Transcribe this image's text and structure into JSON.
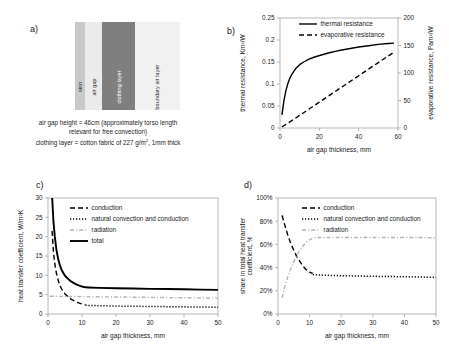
{
  "figure": {
    "panels": {
      "a": {
        "label": "a)"
      },
      "b": {
        "label": "b)"
      },
      "c": {
        "label": "c)"
      },
      "d": {
        "label": "d)"
      }
    }
  },
  "panel_a": {
    "layers": [
      {
        "name": "skin",
        "label": "skin",
        "color": "#c9c9c9"
      },
      {
        "name": "air-gap",
        "label": "air gap",
        "color": "#ebebeb"
      },
      {
        "name": "clothing-layer",
        "label": "clothing layer",
        "color": "#7f7f7f"
      },
      {
        "name": "boundary-air-layer",
        "label": "boundary air layer",
        "color": "#f1f1f1"
      }
    ],
    "caption_line1": "air gap height = 46cm (approximately torso length",
    "caption_line2": "relevant for free convection)",
    "caption_line3_pre": "clothing layer = cotton fabric of 227 g/m",
    "caption_line3_sup": "2",
    "caption_line3_post": ", 1mm thick"
  },
  "chart_data": [
    {
      "id": "panel-b",
      "type": "line",
      "title": "",
      "xlabel": "air gap thickness, mm",
      "ylabel": "thermal resistance, Km²/W",
      "y2label": "evaporative resistance, Pam²/W",
      "xlim": [
        0,
        60
      ],
      "ylim": [
        0,
        0.25
      ],
      "y2lim": [
        0,
        200
      ],
      "xticks": [
        0,
        20,
        40,
        60
      ],
      "yticks": [
        0,
        0.05,
        0.1,
        0.15,
        0.2,
        0.25
      ],
      "yticklabels": [
        "0",
        "0.05",
        "0.1",
        "0.15",
        "0.2",
        "0.25"
      ],
      "y2ticks": [
        0,
        50,
        100,
        150,
        200
      ],
      "grid": false,
      "legend_position": "top-center",
      "series": [
        {
          "name": "thermal resistance",
          "axis": "left",
          "style": "solid",
          "color": "#000000",
          "x": [
            1,
            2,
            3,
            4,
            5,
            6,
            8,
            10,
            12,
            15,
            18,
            21,
            25,
            30,
            35,
            40,
            45,
            50,
            55,
            58
          ],
          "values": [
            0.03,
            0.062,
            0.085,
            0.101,
            0.113,
            0.122,
            0.135,
            0.144,
            0.15,
            0.157,
            0.162,
            0.166,
            0.171,
            0.176,
            0.18,
            0.184,
            0.187,
            0.19,
            0.192,
            0.193
          ]
        },
        {
          "name": "evaporative resistance",
          "axis": "right",
          "style": "dashed",
          "color": "#000000",
          "x": [
            1,
            5,
            10,
            15,
            20,
            25,
            30,
            35,
            40,
            45,
            50,
            55,
            58
          ],
          "values": [
            2,
            11,
            23,
            35,
            47,
            59,
            71,
            83,
            95,
            107,
            119,
            131,
            138
          ]
        }
      ]
    },
    {
      "id": "panel-c",
      "type": "line",
      "title": "",
      "xlabel": "air gap thickness, mm",
      "ylabel": "heat transfer coefficient, W/m²K",
      "xlim": [
        0,
        50
      ],
      "ylim": [
        0,
        30
      ],
      "xticks": [
        0,
        10,
        20,
        30,
        40,
        50
      ],
      "yticks": [
        0,
        5,
        10,
        15,
        20,
        25,
        30
      ],
      "grid": false,
      "legend_position": "top-center",
      "series": [
        {
          "name": "conduction",
          "style": "dashed",
          "color": "#000000",
          "x": [
            1.2,
            1.6,
            2,
            2.5,
            3,
            3.5,
            4,
            5,
            6,
            7,
            8,
            9,
            10,
            11
          ],
          "values": [
            21.5,
            16.0,
            13.0,
            10.4,
            8.7,
            7.4,
            6.5,
            5.2,
            4.3,
            3.7,
            3.3,
            2.9,
            2.6,
            2.4
          ]
        },
        {
          "name": "natural convection and conduction",
          "style": "dotted",
          "color": "#000000",
          "x": [
            11,
            13,
            15,
            18,
            20,
            25,
            30,
            35,
            40,
            45,
            50
          ],
          "values": [
            2.25,
            2.2,
            2.15,
            2.1,
            2.05,
            2.0,
            1.95,
            1.9,
            1.85,
            1.8,
            1.75
          ]
        },
        {
          "name": "radiation",
          "style": "dashdot",
          "color": "#b4b4b4",
          "x": [
            0.5,
            5,
            10,
            15,
            20,
            25,
            30,
            35,
            40,
            45,
            50
          ],
          "values": [
            4.6,
            4.55,
            4.5,
            4.45,
            4.4,
            4.35,
            4.3,
            4.25,
            4.2,
            4.15,
            4.1
          ]
        },
        {
          "name": "total",
          "style": "solid-thick",
          "color": "#000000",
          "x": [
            1.2,
            1.6,
            2,
            2.5,
            3,
            3.5,
            4,
            5,
            6,
            7,
            8,
            9,
            10,
            11,
            12,
            15,
            20,
            25,
            30,
            35,
            40,
            45,
            50
          ],
          "values": [
            30.5,
            24.0,
            20.0,
            16.5,
            14.2,
            12.6,
            11.4,
            9.9,
            9.0,
            8.3,
            7.8,
            7.4,
            7.1,
            6.9,
            6.85,
            6.75,
            6.65,
            6.6,
            6.5,
            6.45,
            6.4,
            6.3,
            6.25
          ]
        }
      ]
    },
    {
      "id": "panel-d",
      "type": "line",
      "title": "",
      "xlabel": "air gap thickness, mm",
      "ylabel": "share in total heat transfer coefficient, %",
      "xlim": [
        0,
        50
      ],
      "ylim": [
        0,
        100
      ],
      "xticks": [
        0,
        10,
        20,
        30,
        40,
        50
      ],
      "yticks": [
        0,
        20,
        40,
        60,
        80,
        100
      ],
      "yticklabels": [
        "0%",
        "20%",
        "40%",
        "60%",
        "80%",
        "100%"
      ],
      "grid": false,
      "legend_position": "top-center",
      "series": [
        {
          "name": "conduction",
          "style": "dashed",
          "color": "#000000",
          "x": [
            1.3,
            2,
            3,
            4,
            5,
            6,
            7,
            8,
            9,
            10,
            11
          ],
          "values": [
            85,
            78,
            69,
            61,
            55,
            49,
            45,
            41,
            38,
            36,
            35
          ]
        },
        {
          "name": "natural convection and conduction",
          "style": "dotted",
          "color": "#000000",
          "x": [
            11,
            13,
            15,
            18,
            20,
            25,
            30,
            35,
            40,
            45,
            50
          ],
          "values": [
            34,
            33.6,
            33.4,
            33.2,
            33.0,
            32.8,
            32.5,
            32.3,
            32.1,
            31.9,
            31.5
          ]
        },
        {
          "name": "radiation",
          "style": "dashdot",
          "color": "#b4b4b4",
          "x": [
            1.3,
            2,
            3,
            4,
            5,
            6,
            7,
            8,
            9,
            10,
            11,
            12,
            15,
            20,
            25,
            30,
            35,
            40,
            45,
            50
          ],
          "values": [
            14,
            22,
            31,
            39,
            45,
            51,
            55,
            59,
            62,
            64,
            65.5,
            66,
            66,
            66,
            66,
            66,
            66,
            66,
            66,
            65.5
          ]
        }
      ]
    }
  ]
}
